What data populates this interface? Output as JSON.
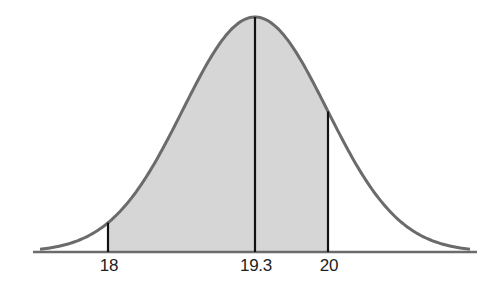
{
  "diagram": {
    "type": "normal-distribution",
    "mean": 19.3,
    "shaded_interval": [
      18,
      20
    ],
    "markers": [
      {
        "value": 18,
        "label": "18"
      },
      {
        "value": 19.3,
        "label": "19.3"
      },
      {
        "value": 20,
        "label": "20"
      }
    ],
    "colors": {
      "curve": "#6b6b6b",
      "shade": "#d6d6d6",
      "markers": "#111111",
      "axis": "#6b6b6b"
    }
  },
  "chart_data": {
    "type": "area",
    "title": "",
    "xlabel": "",
    "ylabel": "",
    "distribution": "normal",
    "mean": 19.3,
    "shaded_region": {
      "from": 18,
      "to": 20
    },
    "tick_labels": [
      "18",
      "19.3",
      "20"
    ],
    "grid": false,
    "legend": null
  }
}
